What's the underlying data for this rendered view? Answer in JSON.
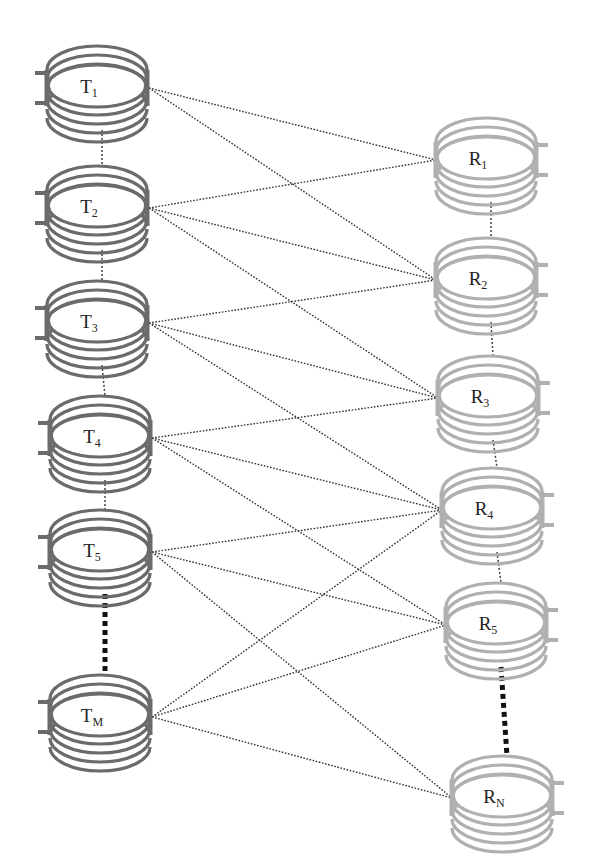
{
  "colors": {
    "tx_coil": "#6b6b6b",
    "rx_coil": "#b0b0b0",
    "link": "#333333",
    "background": "#ffffff"
  },
  "transmitters": [
    {
      "id": "T1",
      "main": "T",
      "sub": "1",
      "cx": 97,
      "cy": 88
    },
    {
      "id": "T2",
      "main": "T",
      "sub": "2",
      "cx": 97,
      "cy": 208
    },
    {
      "id": "T3",
      "main": "T",
      "sub": "3",
      "cx": 97,
      "cy": 323
    },
    {
      "id": "T4",
      "main": "T",
      "sub": "4",
      "cx": 100,
      "cy": 438
    },
    {
      "id": "T5",
      "main": "T",
      "sub": "5",
      "cx": 100,
      "cy": 552
    },
    {
      "id": "TM",
      "main": "T",
      "sub": "M",
      "cx": 100,
      "cy": 717
    }
  ],
  "receivers": [
    {
      "id": "R1",
      "main": "R",
      "sub": "1",
      "cx": 486,
      "cy": 160
    },
    {
      "id": "R2",
      "main": "R",
      "sub": "2",
      "cx": 486,
      "cy": 280
    },
    {
      "id": "R3",
      "main": "R",
      "sub": "3",
      "cx": 488,
      "cy": 398
    },
    {
      "id": "R4",
      "main": "R",
      "sub": "4",
      "cx": 492,
      "cy": 510
    },
    {
      "id": "R5",
      "main": "R",
      "sub": "5",
      "cx": 496,
      "cy": 625
    },
    {
      "id": "RN",
      "main": "R",
      "sub": "N",
      "cx": 502,
      "cy": 798
    }
  ],
  "links": [
    [
      "T1",
      "R1"
    ],
    [
      "T1",
      "R2"
    ],
    [
      "T2",
      "R1"
    ],
    [
      "T2",
      "R2"
    ],
    [
      "T2",
      "R3"
    ],
    [
      "T3",
      "R2"
    ],
    [
      "T3",
      "R3"
    ],
    [
      "T3",
      "R4"
    ],
    [
      "T4",
      "R3"
    ],
    [
      "T4",
      "R4"
    ],
    [
      "T4",
      "R5"
    ],
    [
      "T5",
      "R4"
    ],
    [
      "T5",
      "R5"
    ],
    [
      "T5",
      "RN"
    ],
    [
      "TM",
      "R4"
    ],
    [
      "TM",
      "R5"
    ],
    [
      "TM",
      "RN"
    ]
  ],
  "ellipsis_gaps": {
    "tx": {
      "from": "T5",
      "to": "TM"
    },
    "rx": {
      "from": "R5",
      "to": "RN"
    }
  }
}
